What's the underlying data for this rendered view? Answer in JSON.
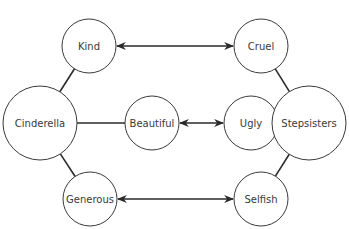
{
  "diagram": {
    "type": "double-bubble-map",
    "nodes": [
      {
        "id": "kind",
        "label": "Kind",
        "cx": 89,
        "cy": 46,
        "r": 27
      },
      {
        "id": "cruel",
        "label": "Cruel",
        "cx": 261,
        "cy": 46,
        "r": 27
      },
      {
        "id": "cinderella",
        "label": "Cinderella",
        "cx": 40,
        "cy": 123,
        "r": 37
      },
      {
        "id": "beautiful",
        "label": "Beautiful",
        "cx": 152,
        "cy": 123,
        "r": 27
      },
      {
        "id": "ugly",
        "label": "Ugly",
        "cx": 251,
        "cy": 123,
        "r": 27
      },
      {
        "id": "stepsisters",
        "label": "Stepsisters",
        "cx": 309,
        "cy": 123,
        "r": 37
      },
      {
        "id": "generous",
        "label": "Generous",
        "cx": 90,
        "cy": 199,
        "r": 27
      },
      {
        "id": "selfish",
        "label": "Selfish",
        "cx": 261,
        "cy": 199,
        "r": 27
      }
    ],
    "edges": [
      {
        "from": "cinderella",
        "to": "kind"
      },
      {
        "from": "cinderella",
        "to": "beautiful"
      },
      {
        "from": "cinderella",
        "to": "generous"
      },
      {
        "from": "stepsisters",
        "to": "cruel"
      },
      {
        "from": "stepsisters",
        "to": "ugly"
      },
      {
        "from": "stepsisters",
        "to": "selfish"
      }
    ],
    "contrasts": [
      {
        "from": "kind",
        "to": "cruel"
      },
      {
        "from": "beautiful",
        "to": "ugly"
      },
      {
        "from": "generous",
        "to": "selfish"
      }
    ]
  }
}
